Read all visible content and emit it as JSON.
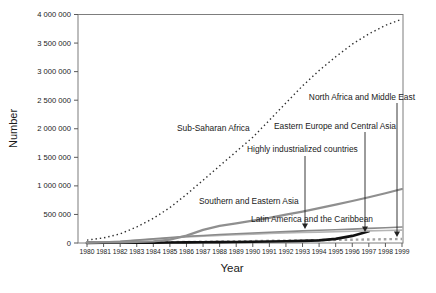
{
  "figure": {
    "background": "#ffffff"
  },
  "chart_data": {
    "type": "line",
    "title": "",
    "xlabel": "Year",
    "ylabel": "Number",
    "grid": false,
    "legend": "inline-labels",
    "ylim": [
      0,
      4000000
    ],
    "x": [
      1980,
      1981,
      1982,
      1983,
      1984,
      1985,
      1986,
      1987,
      1988,
      1989,
      1990,
      1991,
      1992,
      1993,
      1994,
      1995,
      1996,
      1997,
      1998,
      1999
    ],
    "x_tick_labels": [
      "1980",
      "1981",
      "1982",
      "1983",
      "1984",
      "1985",
      "1986",
      "1987",
      "1988",
      "1989",
      "1990",
      "1991",
      "1992",
      "1993",
      "1994",
      "1995",
      "1996",
      "1997",
      "1998",
      "1999"
    ],
    "y_ticks": [
      0,
      500000,
      1000000,
      1500000,
      2000000,
      2500000,
      3000000,
      3500000,
      4000000
    ],
    "y_tick_labels": [
      "0",
      "500 000",
      "1 000 000",
      "1 500 000",
      "2 000 000",
      "2 500 000",
      "3 000 000",
      "3 500 000",
      "4 000 000"
    ],
    "series": [
      {
        "name": "Sub-Saharan Africa",
        "style": "dotted",
        "color": "#2e2e2e",
        "width": 1.4,
        "dash": "1.4 2.9",
        "values": [
          50000,
          90000,
          160000,
          280000,
          430000,
          620000,
          850000,
          1100000,
          1350000,
          1600000,
          1850000,
          2150000,
          2450000,
          2750000,
          3020000,
          3260000,
          3480000,
          3660000,
          3810000,
          3920000
        ]
      },
      {
        "name": "Southern and Eastern Asia",
        "style": "solid",
        "color": "#8f8f8f",
        "width": 2.2,
        "dash": null,
        "values": [
          5000,
          8000,
          12000,
          18000,
          30000,
          60000,
          130000,
          230000,
          300000,
          345000,
          390000,
          440000,
          495000,
          550000,
          610000,
          670000,
          735000,
          800000,
          870000,
          945000
        ]
      },
      {
        "name": "Latin America and the Caribbean",
        "style": "solid",
        "color": "#8a8a8a",
        "width": 1.6,
        "dash": null,
        "values": [
          5000,
          15000,
          30000,
          50000,
          72000,
          95000,
          115000,
          132000,
          148000,
          162000,
          175000,
          188000,
          200000,
          211000,
          222000,
          233000,
          244000,
          256000,
          268000,
          280000
        ]
      },
      {
        "name": "Highly industrialized countries",
        "style": "solid",
        "color": "#b5b5b5",
        "width": 1.6,
        "dash": null,
        "values": [
          4000,
          12000,
          26000,
          45000,
          65000,
          88000,
          105000,
          120000,
          133000,
          145000,
          156000,
          166000,
          175000,
          183000,
          191000,
          198000,
          205000,
          212000,
          219000,
          226000
        ]
      },
      {
        "name": "Eastern Europe and Central Asia",
        "style": "solid",
        "color": "#111111",
        "width": 2.6,
        "dash": null,
        "values": [
          2000,
          3000,
          4000,
          5000,
          6000,
          8000,
          10000,
          12000,
          15000,
          18000,
          22000,
          26000,
          30000,
          36000,
          46000,
          72000,
          125000,
          205000,
          null,
          null
        ]
      },
      {
        "name": "North Africa and Middle East",
        "style": "dashed",
        "color": "#a3a3a3",
        "width": 2.4,
        "dash": "2.6 3",
        "values": [
          2000,
          4000,
          6000,
          9000,
          12000,
          15000,
          18000,
          22000,
          26000,
          30000,
          34000,
          38000,
          42000,
          46000,
          50000,
          54000,
          58000,
          62000,
          66000,
          70000
        ]
      }
    ],
    "annotations": {
      "inline_labels": [
        {
          "text": "Sub-Saharan Africa",
          "x": 177,
          "y": 131,
          "anchor": "start"
        },
        {
          "text": "Southern and Eastern Asia",
          "x": 199,
          "y": 204,
          "anchor": "start"
        },
        {
          "text": "Latin America and the Caribbean",
          "x": 251,
          "y": 222,
          "anchor": "start"
        }
      ],
      "arrow_labels": [
        {
          "text": "North Africa and Middle East",
          "text_x": 415,
          "text_y": 100,
          "anchor": "end",
          "arrow_x": 397,
          "line_top": 103,
          "tip_y": 237
        },
        {
          "text": "Eastern Europe and Central Asia",
          "text_x": 396,
          "text_y": 129,
          "anchor": "end",
          "arrow_x": 365,
          "line_top": 132,
          "tip_y": 232
        },
        {
          "text": "Highly industrialized countries",
          "text_x": 247,
          "text_y": 152,
          "anchor": "start",
          "arrow_x": 305,
          "line_top": 156,
          "tip_y": 229
        }
      ]
    },
    "layout": {
      "left": 78,
      "top": 14.5,
      "right": 403,
      "bottom": 243,
      "x_first": 87,
      "x_last": 402,
      "tick_len": 4,
      "x_label_baseline": 254,
      "y_label_font": 7.6,
      "x_label_font": 6.7,
      "annotation_font": 8.4
    },
    "colors": {
      "frame": "#7d7d7d",
      "tick": "#5a5a5a",
      "text": "#1a1a1a",
      "arrow": "#222222"
    }
  }
}
